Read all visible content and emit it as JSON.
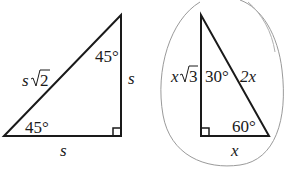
{
  "triangle_45": {
    "hypotenuse_var": "s",
    "hypotenuse_root": "2",
    "top_angle": "45°",
    "bottom_angle": "45°",
    "right_leg": "s",
    "bottom_leg": "s"
  },
  "triangle_30_60": {
    "left_leg_var": "x",
    "left_leg_root": "3",
    "top_angle": "30°",
    "hypotenuse": "2x",
    "bottom_angle": "60°",
    "bottom_leg": "x"
  },
  "colors": {
    "line": "#1a1a1a",
    "oval": "#9a9a9a"
  }
}
